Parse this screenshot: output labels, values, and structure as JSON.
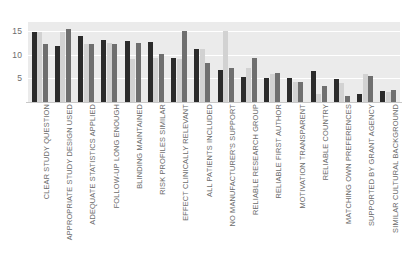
{
  "chart_data": {
    "type": "bar",
    "title": "",
    "subtitle": "",
    "xlabel": "",
    "ylabel": "",
    "ylim": [
      0,
      17
    ],
    "yticks": [
      5,
      10,
      15
    ],
    "ytick_labels": [
      "5",
      "10",
      "15"
    ],
    "grid": true,
    "grid_axis": "y",
    "legend": false,
    "legend_position": "none",
    "orientation": "vertical",
    "grouping": "grouped",
    "categories": [
      "CLEAR STUDY QUESTION",
      "APPROPRIATE STUDY DESIGN USED",
      "ADEQUATE STATISTICS APPLIED",
      "FOLLOW-UP LONG ENOUGH",
      "BLINDING MAINTAINED",
      "RISK PROFILES SIMILAR",
      "EFFECT CLINICALLY RELEVANT",
      "ALL PATIENTS INCLUDED",
      "NO MANUFACTURER'S SUPPORT",
      "RELIABLE RESEARCH GROUP",
      "RELIABLE FIRST AUTHOR",
      "MOTIVATION TRANSPARENT",
      "RELIABLE COUNTRY",
      "MATCHING OWN PREFERENCES",
      "SUPPORTED BY GRANT AGENCY",
      "SIMILAR CULTURAL BACKGROUND"
    ],
    "series": [
      {
        "name": "Series 1",
        "color": "#2b2b2b",
        "values": [
          14.8,
          11.9,
          14.1,
          13.2,
          13.0,
          12.8,
          9.3,
          11.2,
          6.8,
          5.3,
          5.1,
          5.1,
          6.5,
          4.8,
          1.7,
          2.4
        ]
      },
      {
        "name": "Series 2",
        "color": "#d2d2d2",
        "values": [
          14.8,
          14.8,
          12.4,
          12.5,
          9.1,
          9.3,
          9.1,
          11.2,
          15.0,
          7.3,
          6.0,
          4.3,
          1.7,
          4.0,
          6.0,
          2.2
        ]
      },
      {
        "name": "Series 3",
        "color": "#6f6f6f",
        "values": [
          12.4,
          15.6,
          12.4,
          12.4,
          12.5,
          10.2,
          15.0,
          8.2,
          7.3,
          9.3,
          6.2,
          4.3,
          3.5,
          1.2,
          5.6,
          2.6
        ]
      }
    ]
  },
  "colors": {
    "plot_background": "#ebebeb",
    "gridline": "#ffffff",
    "axis_line": "#c8c8c8",
    "tick_text": "#6b6b6b",
    "page_background": "#ffffff"
  }
}
